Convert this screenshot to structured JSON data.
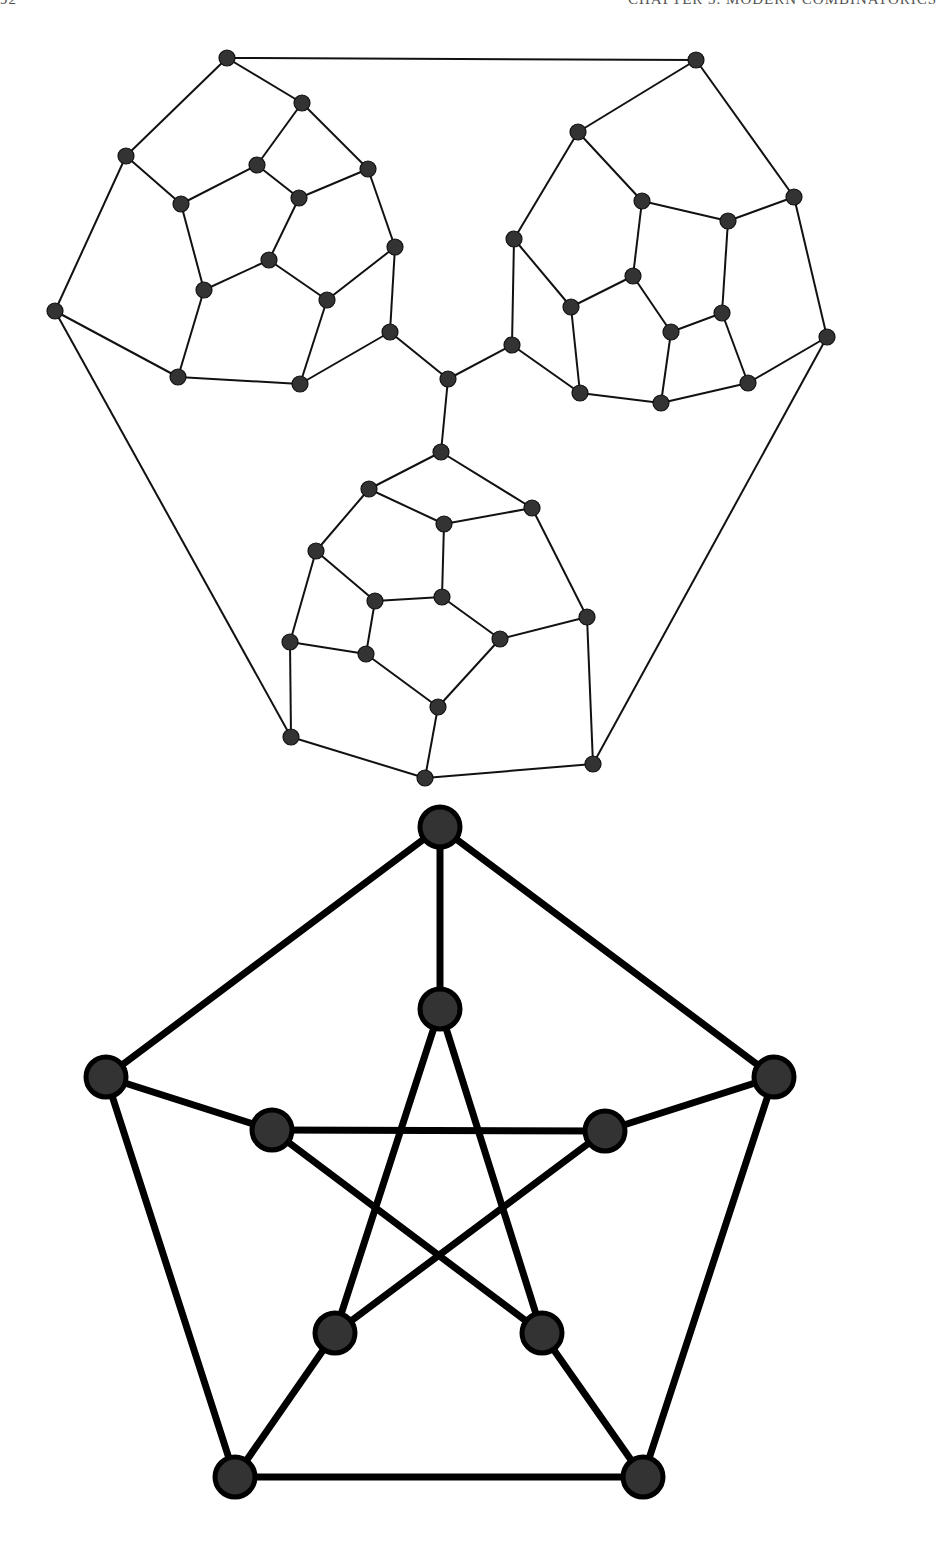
{
  "running_head": {
    "page_number": "92",
    "chapter_title": "CHAPTER 3.  MODERN COMBINATORICS"
  },
  "figures": [
    {
      "id": "cubic-graph-three-clusters",
      "description": "Cubic planar graph made of three pentagonal-face clusters joined at a central vertex",
      "style": {
        "node_radius": 8,
        "edge_width": 2,
        "node_fill": "#333333",
        "edge_color": "#111111"
      },
      "nodes": {
        "A": [
          227,
          58
        ],
        "B": [
          302,
          103
        ],
        "C": [
          126,
          156
        ],
        "D": [
          257,
          165
        ],
        "E": [
          368,
          169
        ],
        "F": [
          181,
          204
        ],
        "G": [
          299,
          198
        ],
        "H": [
          395,
          247
        ],
        "I": [
          269,
          260
        ],
        "J": [
          204,
          290
        ],
        "K": [
          327,
          300
        ],
        "L": [
          55,
          311
        ],
        "M": [
          390,
          332
        ],
        "N": [
          178,
          377
        ],
        "O": [
          300,
          384
        ],
        "P": [
          696,
          60
        ],
        "Q": [
          578,
          132
        ],
        "R": [
          794,
          197
        ],
        "S": [
          642,
          201
        ],
        "T": [
          728,
          221
        ],
        "U": [
          514,
          239
        ],
        "V": [
          633,
          276
        ],
        "W": [
          571,
          307
        ],
        "X": [
          722,
          313
        ],
        "Y": [
          671,
          332
        ],
        "Z": [
          827,
          337
        ],
        "a": [
          512,
          345
        ],
        "b": [
          580,
          393
        ],
        "c": [
          748,
          383
        ],
        "d": [
          661,
          403
        ],
        "ctr": [
          448,
          379
        ],
        "e": [
          441,
          452
        ],
        "f": [
          369,
          489
        ],
        "g": [
          532,
          508
        ],
        "h": [
          444,
          524
        ],
        "i": [
          316,
          551
        ],
        "j": [
          375,
          601
        ],
        "k": [
          442,
          597
        ],
        "l": [
          587,
          617
        ],
        "m": [
          500,
          639
        ],
        "n": [
          290,
          642
        ],
        "o": [
          366,
          654
        ],
        "p": [
          438,
          707
        ],
        "q": [
          291,
          737
        ],
        "r": [
          425,
          778
        ],
        "s": [
          593,
          764
        ]
      },
      "edges": [
        [
          "A",
          "P"
        ],
        [
          "A",
          "B"
        ],
        [
          "A",
          "C"
        ],
        [
          "B",
          "D"
        ],
        [
          "B",
          "E"
        ],
        [
          "C",
          "F"
        ],
        [
          "C",
          "L"
        ],
        [
          "D",
          "F"
        ],
        [
          "D",
          "G"
        ],
        [
          "G",
          "E"
        ],
        [
          "G",
          "I"
        ],
        [
          "E",
          "H"
        ],
        [
          "F",
          "J"
        ],
        [
          "I",
          "J"
        ],
        [
          "I",
          "K"
        ],
        [
          "K",
          "H"
        ],
        [
          "H",
          "M"
        ],
        [
          "J",
          "N"
        ],
        [
          "K",
          "O"
        ],
        [
          "L",
          "N"
        ],
        [
          "N",
          "O"
        ],
        [
          "O",
          "M"
        ],
        [
          "M",
          "ctr"
        ],
        [
          "L",
          "q"
        ],
        [
          "P",
          "Q"
        ],
        [
          "P",
          "R"
        ],
        [
          "Q",
          "U"
        ],
        [
          "Q",
          "S"
        ],
        [
          "S",
          "T"
        ],
        [
          "T",
          "R"
        ],
        [
          "S",
          "V"
        ],
        [
          "T",
          "X"
        ],
        [
          "U",
          "W"
        ],
        [
          "U",
          "a"
        ],
        [
          "V",
          "W"
        ],
        [
          "V",
          "Y"
        ],
        [
          "Y",
          "X"
        ],
        [
          "X",
          "c"
        ],
        [
          "R",
          "Z"
        ],
        [
          "W",
          "b"
        ],
        [
          "Y",
          "d"
        ],
        [
          "a",
          "b"
        ],
        [
          "b",
          "d"
        ],
        [
          "d",
          "c"
        ],
        [
          "c",
          "Z"
        ],
        [
          "a",
          "ctr"
        ],
        [
          "Z",
          "s"
        ],
        [
          "ctr",
          "e"
        ],
        [
          "e",
          "f"
        ],
        [
          "e",
          "g"
        ],
        [
          "f",
          "h"
        ],
        [
          "f",
          "i"
        ],
        [
          "h",
          "g"
        ],
        [
          "h",
          "k"
        ],
        [
          "g",
          "l"
        ],
        [
          "i",
          "j"
        ],
        [
          "i",
          "n"
        ],
        [
          "j",
          "k"
        ],
        [
          "j",
          "o"
        ],
        [
          "k",
          "m"
        ],
        [
          "m",
          "l"
        ],
        [
          "m",
          "p"
        ],
        [
          "n",
          "o"
        ],
        [
          "n",
          "q"
        ],
        [
          "o",
          "p"
        ],
        [
          "p",
          "r"
        ],
        [
          "q",
          "r"
        ],
        [
          "r",
          "s"
        ],
        [
          "s",
          "l"
        ]
      ]
    },
    {
      "id": "petersen-graph",
      "description": "Petersen graph: outer pentagon, inner pentagram, five spokes",
      "style": {
        "node_radius": 22,
        "edge_width": 7,
        "node_fill": "#333333",
        "edge_color": "#000000"
      },
      "nodes": {
        "o1": [
          440,
          827
        ],
        "o2": [
          774,
          1077
        ],
        "o3": [
          643,
          1477
        ],
        "o4": [
          235,
          1477
        ],
        "o5": [
          106,
          1077
        ],
        "i1": [
          440,
          1009
        ],
        "i2": [
          605,
          1131
        ],
        "i3": [
          542,
          1333
        ],
        "i4": [
          335,
          1333
        ],
        "i5": [
          272,
          1130
        ]
      },
      "edges": [
        [
          "o1",
          "o2"
        ],
        [
          "o2",
          "o3"
        ],
        [
          "o3",
          "o4"
        ],
        [
          "o4",
          "o5"
        ],
        [
          "o5",
          "o1"
        ],
        [
          "o1",
          "i1"
        ],
        [
          "o2",
          "i2"
        ],
        [
          "o3",
          "i3"
        ],
        [
          "o4",
          "i4"
        ],
        [
          "o5",
          "i5"
        ],
        [
          "i1",
          "i3"
        ],
        [
          "i3",
          "i5"
        ],
        [
          "i5",
          "i2"
        ],
        [
          "i2",
          "i4"
        ],
        [
          "i4",
          "i1"
        ]
      ]
    }
  ]
}
